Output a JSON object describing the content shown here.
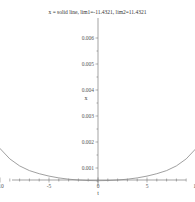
{
  "chart_data": {
    "type": "line",
    "title": "x = solid line, lim1=-11.4321, lim2=11.4321",
    "xlabel": "t",
    "ylabel": "x",
    "x_ticks": [
      -10,
      -5,
      0,
      5,
      10
    ],
    "x_tick_labels": [
      "-10",
      "-5",
      "0",
      "5",
      "10"
    ],
    "y_ticks": [
      0.001,
      0.002,
      0.003,
      0.004,
      0.005,
      0.006
    ],
    "y_tick_labels": [
      "0.001",
      "0.002",
      "0.003",
      "0.004",
      "0.005",
      "0.006"
    ],
    "xlim": [
      -14.5,
      14.5
    ],
    "ylim": [
      0.0003,
      0.0068
    ],
    "grid": false,
    "legend": null,
    "series": [
      {
        "name": "x",
        "style": "solid",
        "color": "#888888",
        "x": [
          -12.8,
          -12.5,
          -12,
          -11.5,
          -11,
          -10,
          -9,
          -8,
          -7,
          -6,
          -5,
          -4,
          -3,
          -2,
          -1,
          0,
          1,
          2,
          3,
          4,
          5,
          6,
          7,
          8,
          9,
          10,
          11,
          11.5,
          12,
          12.5,
          12.8
        ],
        "y": [
          0.0068,
          0.0052,
          0.0037,
          0.0029,
          0.0024,
          0.00175,
          0.00135,
          0.00108,
          0.0009,
          0.00078,
          0.00069,
          0.00062,
          0.00057,
          0.00054,
          0.00052,
          0.00051,
          0.00052,
          0.00054,
          0.00057,
          0.00062,
          0.00069,
          0.00078,
          0.0009,
          0.00108,
          0.00135,
          0.00175,
          0.0024,
          0.0029,
          0.0037,
          0.0052,
          0.0068
        ]
      }
    ]
  },
  "colors": {
    "axis": "#666666",
    "curve": "#888888",
    "background": "#ffffff"
  }
}
